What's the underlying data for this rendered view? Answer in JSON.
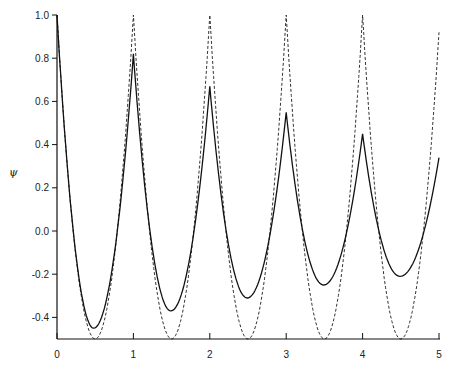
{
  "chart_data": {
    "type": "line",
    "title": "",
    "xlabel": "",
    "ylabel": "ψ",
    "xlim": [
      0,
      5
    ],
    "ylim": [
      -0.5,
      1.0
    ],
    "grid": false,
    "legend": null,
    "x_ticks": [
      "0",
      "1",
      "2",
      "3",
      "4",
      "5"
    ],
    "y_ticks": [
      "1.0",
      "0.8",
      "0.6",
      "0.4",
      "0.2",
      "0.0",
      "-0.2",
      "-0.4"
    ],
    "series": [
      {
        "name": "solid",
        "style": "solid",
        "peaks": [
          {
            "x": 0,
            "y": 1.0
          },
          {
            "x": 1,
            "y": 0.82
          },
          {
            "x": 2,
            "y": 0.67
          },
          {
            "x": 3,
            "y": 0.55
          },
          {
            "x": 4,
            "y": 0.45
          }
        ],
        "minima": [
          {
            "x": 0.48,
            "y": -0.45
          },
          {
            "x": 1.49,
            "y": -0.37
          },
          {
            "x": 2.49,
            "y": -0.31
          },
          {
            "x": 3.49,
            "y": -0.25
          },
          {
            "x": 4.49,
            "y": -0.21
          }
        ],
        "end": {
          "x": 5,
          "y": 0.34
        }
      },
      {
        "name": "dashed",
        "style": "dashed",
        "peaks": [
          {
            "x": 0,
            "y": 1.0
          },
          {
            "x": 1,
            "y": 1.0
          },
          {
            "x": 2,
            "y": 1.0
          },
          {
            "x": 3,
            "y": 1.0
          },
          {
            "x": 4,
            "y": 1.0
          }
        ],
        "minima": [
          {
            "x": 0.5,
            "y": -0.5
          },
          {
            "x": 1.5,
            "y": -0.5
          },
          {
            "x": 2.5,
            "y": -0.5
          },
          {
            "x": 3.5,
            "y": -0.5
          },
          {
            "x": 4.5,
            "y": -0.5
          }
        ],
        "end": {
          "x": 5,
          "y": 0.92
        }
      }
    ]
  },
  "axes": {
    "y_label": "ψ"
  }
}
